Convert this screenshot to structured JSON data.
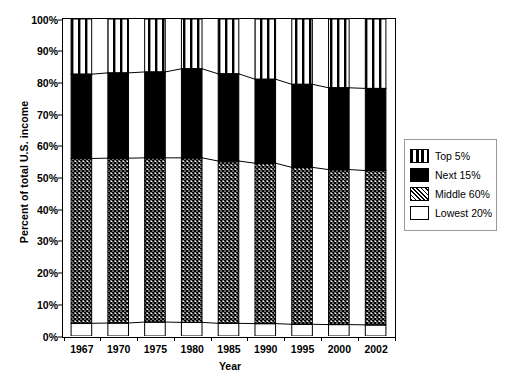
{
  "chart_data": {
    "type": "area",
    "title": "",
    "subtitle": "",
    "xlabel": "Year",
    "ylabel": "Percent of total U.S. income",
    "categories": [
      "1967",
      "1970",
      "1975",
      "1980",
      "1985",
      "1990",
      "1995",
      "2000",
      "2002"
    ],
    "x": [
      1967,
      1970,
      1975,
      1980,
      1985,
      1990,
      1995,
      2000,
      2002
    ],
    "ylim": [
      0,
      100
    ],
    "ytick_labels": [
      "0%",
      "10%",
      "20%",
      "30%",
      "40%",
      "50%",
      "60%",
      "70%",
      "80%",
      "90%",
      "100%"
    ],
    "ytick_values": [
      0,
      10,
      20,
      30,
      40,
      50,
      60,
      70,
      80,
      90,
      100
    ],
    "grid": false,
    "legend_position": "right",
    "stacked": true,
    "series": [
      {
        "name": "Lowest 20%",
        "order": 1,
        "fill": "solid-white",
        "values": [
          4.0,
          4.1,
          4.4,
          4.3,
          4.0,
          3.9,
          3.7,
          3.6,
          3.5
        ]
      },
      {
        "name": "Middle 60%",
        "order": 2,
        "fill": "crosshatch",
        "values": [
          52.0,
          52.0,
          51.8,
          51.9,
          51.2,
          50.6,
          49.5,
          48.9,
          48.7
        ]
      },
      {
        "name": "Next 15%",
        "order": 3,
        "fill": "solid-black",
        "values": [
          26.6,
          26.9,
          27.1,
          28.1,
          27.5,
          26.5,
          26.2,
          25.8,
          25.9
        ]
      },
      {
        "name": "Top 5%",
        "order": 4,
        "fill": "vertical-stripes",
        "values": [
          17.4,
          17.0,
          16.7,
          15.7,
          17.3,
          19.0,
          20.6,
          21.7,
          21.9
        ]
      }
    ],
    "cumulative_tops": {
      "lowest_20": [
        4.0,
        4.1,
        4.4,
        4.3,
        4.0,
        3.9,
        3.7,
        3.6,
        3.5
      ],
      "middle_60": [
        56.0,
        56.1,
        56.2,
        56.2,
        55.2,
        54.5,
        53.2,
        52.5,
        52.2
      ],
      "next_15": [
        82.6,
        83.0,
        83.3,
        84.3,
        82.7,
        81.0,
        79.4,
        78.3,
        78.1
      ],
      "top_5": [
        100,
        100,
        100,
        100,
        100,
        100,
        100,
        100,
        100
      ]
    }
  },
  "legend": {
    "items": [
      {
        "label": "Top 5%",
        "pattern": "vertical-stripes"
      },
      {
        "label": "Next 15%",
        "pattern": "solid-black"
      },
      {
        "label": "Middle 60%",
        "pattern": "crosshatch"
      },
      {
        "label": "Lowest 20%",
        "pattern": "solid-white"
      }
    ]
  },
  "colors": {
    "ink": "#000000",
    "plot_background": "#ffffff",
    "legend_border": "#9a9a9a",
    "band_lowest20": "#ffffff",
    "band_middle60": "#808080",
    "band_next15": "#000000",
    "band_top5": "#ffffff"
  }
}
